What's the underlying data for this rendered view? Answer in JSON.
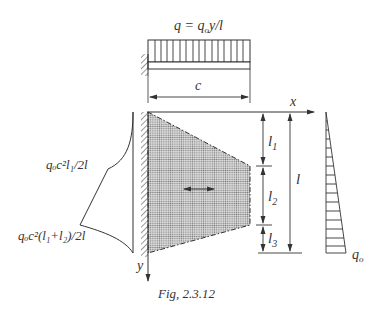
{
  "figure": {
    "caption": "Fig, 2.3.12",
    "load_label": "q = q",
    "load_label_sub": "o",
    "load_label_tail": "y/l",
    "dim_c": "c",
    "axis_x": "x",
    "axis_y": "y",
    "dim_l1": "l",
    "dim_l1_sub": "1",
    "dim_l2": "l",
    "dim_l2_sub": "2",
    "dim_l3": "l",
    "dim_l3_sub": "3",
    "dim_l": "l",
    "moment_label_1": "qₒc²l₁/2l",
    "moment_label_2": "qₒc²(l₁+l₂)/2l",
    "right_load_label": "q",
    "right_load_sub": "o"
  },
  "colors": {
    "line": "#333333",
    "plate_fill": "#bdbdbd"
  }
}
